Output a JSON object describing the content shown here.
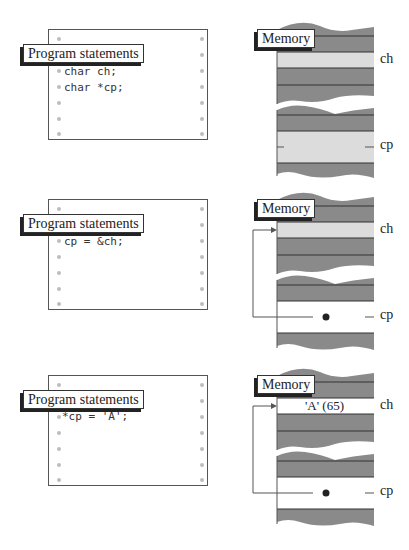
{
  "colors": {
    "dark_cell": "#8a8a8a",
    "light_cell": "#dcdcdc",
    "white_cell": "#ffffff",
    "line": "#333333",
    "dot": "#bdbdbd"
  },
  "panels": [
    {
      "program_label": "Program statements",
      "code_lines": [
        "char ch;",
        "char *cp;"
      ],
      "memory_label": "Memory",
      "ch_label": "ch",
      "cp_label": "cp",
      "ch_value": "",
      "ch_state": "light",
      "cp_state": "light",
      "pointer_arrow": false
    },
    {
      "program_label": "Program statements",
      "code_lines": [
        "cp = &ch;"
      ],
      "memory_label": "Memory",
      "ch_label": "ch",
      "cp_label": "cp",
      "ch_value": "",
      "ch_state": "light",
      "cp_state": "white",
      "pointer_arrow": true
    },
    {
      "program_label": "Program statements",
      "code_lines": [
        "*cp = 'A';"
      ],
      "memory_label": "Memory",
      "ch_label": "ch",
      "cp_label": "cp",
      "ch_value": "'A' (65)",
      "ch_state": "white",
      "cp_state": "white",
      "pointer_arrow": true
    }
  ]
}
